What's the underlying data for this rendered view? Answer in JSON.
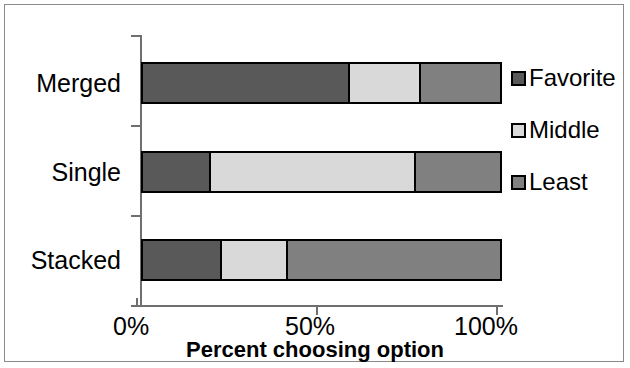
{
  "chart_data": {
    "type": "bar",
    "subtype": "horizontal stacked bar (100%)",
    "title": "",
    "xlabel": "Percent choosing option",
    "ylabel": "",
    "xlim": [
      0,
      100
    ],
    "xticks": [
      "0%",
      "50%",
      "100%"
    ],
    "xtick_values": [
      0,
      50,
      100
    ],
    "grid": false,
    "legend_position": "right",
    "categories": [
      "Merged",
      "Single",
      "Stacked"
    ],
    "series": [
      {
        "name": "Favorite",
        "color": "#595959",
        "values": [
          57.5,
          18.5,
          21.5
        ]
      },
      {
        "name": "Middle",
        "color": "#d9d9d9",
        "values": [
          20.5,
          58.0,
          19.0
        ]
      },
      {
        "name": "Least",
        "color": "#808080",
        "values": [
          22.0,
          23.5,
          59.5
        ]
      }
    ]
  },
  "axis": {
    "x_title": "Percent choosing option",
    "tick_labels": [
      "0%",
      "50%",
      "100%"
    ],
    "category_labels": [
      "Merged",
      "Single",
      "Stacked"
    ]
  },
  "legend": {
    "items": [
      {
        "label": "Favorite",
        "color": "#595959"
      },
      {
        "label": "Middle",
        "color": "#d9d9d9"
      },
      {
        "label": "Least",
        "color": "#808080"
      }
    ]
  },
  "colors": {
    "favorite": "#595959",
    "middle": "#d9d9d9",
    "least": "#808080",
    "axis": "#6f6f6f",
    "outline": "#000000",
    "frame": "#8a8a8a",
    "background": "#ffffff"
  }
}
